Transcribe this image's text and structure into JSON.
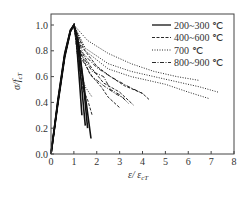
{
  "chart_data": {
    "type": "line",
    "title": "",
    "xlabel": "ε/ ε_cT",
    "ylabel": "σ/f_cT",
    "xlim": [
      0,
      8
    ],
    "ylim": [
      0,
      1.05
    ],
    "xticks": [
      0,
      1,
      2,
      3,
      4,
      5,
      6,
      7,
      8
    ],
    "yticks": [
      0.0,
      0.2,
      0.4,
      0.6,
      0.8,
      1.0
    ],
    "xtick_labels": [
      "0",
      "1",
      "2",
      "3",
      "4",
      "5",
      "6",
      "7",
      "8"
    ],
    "ytick_labels": [
      "0.0",
      "0.2",
      "0.4",
      "0.6",
      "0.8",
      "1.0"
    ],
    "grid": false,
    "legend_position": "upper right",
    "series": [
      {
        "name": "200~300 ℃",
        "style": "solid",
        "curves": [
          [
            [
              0,
              0
            ],
            [
              0.3,
              0.42
            ],
            [
              0.6,
              0.78
            ],
            [
              0.85,
              0.96
            ],
            [
              1.0,
              1.0
            ],
            [
              1.1,
              0.9
            ],
            [
              1.25,
              0.55
            ],
            [
              1.35,
              0.3
            ]
          ],
          [
            [
              0,
              0
            ],
            [
              0.3,
              0.4
            ],
            [
              0.6,
              0.76
            ],
            [
              0.85,
              0.95
            ],
            [
              1.0,
              1.0
            ],
            [
              1.15,
              0.88
            ],
            [
              1.35,
              0.5
            ],
            [
              1.5,
              0.22
            ]
          ],
          [
            [
              0,
              0
            ],
            [
              0.3,
              0.41
            ],
            [
              0.6,
              0.77
            ],
            [
              0.85,
              0.96
            ],
            [
              1.0,
              1.0
            ],
            [
              1.2,
              0.86
            ],
            [
              1.45,
              0.48
            ],
            [
              1.6,
              0.2
            ]
          ],
          [
            [
              0,
              0
            ],
            [
              0.3,
              0.39
            ],
            [
              0.6,
              0.75
            ],
            [
              0.85,
              0.95
            ],
            [
              1.0,
              1.0
            ],
            [
              1.2,
              0.85
            ],
            [
              1.5,
              0.45
            ],
            [
              1.75,
              0.12
            ]
          ]
        ]
      },
      {
        "name": "400~600 ℃",
        "style": "dashed",
        "curves": [
          [
            [
              0,
              0
            ],
            [
              0.3,
              0.4
            ],
            [
              0.6,
              0.76
            ],
            [
              0.85,
              0.95
            ],
            [
              1.0,
              1.0
            ],
            [
              1.3,
              0.78
            ],
            [
              1.7,
              0.62
            ],
            [
              2.2,
              0.52
            ],
            [
              2.5,
              0.44
            ],
            [
              3.0,
              0.36
            ]
          ],
          [
            [
              0,
              0
            ],
            [
              0.3,
              0.4
            ],
            [
              0.6,
              0.76
            ],
            [
              0.85,
              0.95
            ],
            [
              1.0,
              1.0
            ],
            [
              1.3,
              0.8
            ],
            [
              1.8,
              0.66
            ],
            [
              2.3,
              0.55
            ],
            [
              3.0,
              0.48
            ],
            [
              3.6,
              0.38
            ]
          ],
          [
            [
              0,
              0
            ],
            [
              0.3,
              0.4
            ],
            [
              0.6,
              0.76
            ],
            [
              0.85,
              0.95
            ],
            [
              1.0,
              1.0
            ],
            [
              1.4,
              0.82
            ],
            [
              2.0,
              0.68
            ],
            [
              2.6,
              0.6
            ],
            [
              3.2,
              0.53
            ],
            [
              4.0,
              0.47
            ],
            [
              4.3,
              0.42
            ]
          ],
          [
            [
              0,
              0
            ],
            [
              0.3,
              0.4
            ],
            [
              0.6,
              0.76
            ],
            [
              0.85,
              0.95
            ],
            [
              1.0,
              1.0
            ],
            [
              1.2,
              0.7
            ],
            [
              1.4,
              0.5
            ],
            [
              1.6,
              0.42
            ],
            [
              1.8,
              0.3
            ]
          ]
        ]
      },
      {
        "name": "700 ℃",
        "style": "dotted",
        "curves": [
          [
            [
              0,
              0
            ],
            [
              0.3,
              0.4
            ],
            [
              0.6,
              0.76
            ],
            [
              0.85,
              0.95
            ],
            [
              1.0,
              1.0
            ],
            [
              1.6,
              0.88
            ],
            [
              2.5,
              0.78
            ],
            [
              3.5,
              0.7
            ],
            [
              4.5,
              0.64
            ],
            [
              5.5,
              0.6
            ],
            [
              6.5,
              0.57
            ]
          ],
          [
            [
              0,
              0
            ],
            [
              0.3,
              0.4
            ],
            [
              0.6,
              0.76
            ],
            [
              0.85,
              0.95
            ],
            [
              1.0,
              1.0
            ],
            [
              1.5,
              0.82
            ],
            [
              2.5,
              0.7
            ],
            [
              3.5,
              0.64
            ],
            [
              5.0,
              0.58
            ],
            [
              6.5,
              0.52
            ],
            [
              7.3,
              0.48
            ]
          ],
          [
            [
              0,
              0
            ],
            [
              0.3,
              0.4
            ],
            [
              0.6,
              0.76
            ],
            [
              0.85,
              0.95
            ],
            [
              1.0,
              1.0
            ],
            [
              1.5,
              0.8
            ],
            [
              2.5,
              0.66
            ],
            [
              3.5,
              0.6
            ],
            [
              5.0,
              0.54
            ],
            [
              6.0,
              0.48
            ],
            [
              6.9,
              0.43
            ]
          ],
          [
            [
              0,
              0
            ],
            [
              0.3,
              0.4
            ],
            [
              0.6,
              0.76
            ],
            [
              0.85,
              0.95
            ],
            [
              1.0,
              1.0
            ],
            [
              1.2,
              0.7
            ],
            [
              1.5,
              0.52
            ],
            [
              1.8,
              0.44
            ]
          ]
        ]
      },
      {
        "name": "800~900 ℃",
        "style": "dash-dot",
        "curves": [
          [
            [
              0,
              0
            ],
            [
              0.3,
              0.4
            ],
            [
              0.6,
              0.76
            ],
            [
              0.85,
              0.95
            ],
            [
              1.0,
              1.0
            ],
            [
              1.4,
              0.78
            ],
            [
              2.0,
              0.67
            ],
            [
              2.6,
              0.6
            ],
            [
              3.3,
              0.53
            ],
            [
              4.0,
              0.47
            ]
          ],
          [
            [
              0,
              0
            ],
            [
              0.3,
              0.4
            ],
            [
              0.6,
              0.76
            ],
            [
              0.85,
              0.95
            ],
            [
              1.0,
              1.0
            ],
            [
              1.3,
              0.78
            ],
            [
              1.8,
              0.64
            ],
            [
              2.3,
              0.6
            ],
            [
              2.6,
              0.5
            ],
            [
              3.0,
              0.46
            ],
            [
              3.4,
              0.39
            ]
          ],
          [
            [
              0,
              0
            ],
            [
              0.3,
              0.4
            ],
            [
              0.6,
              0.76
            ],
            [
              0.85,
              0.95
            ],
            [
              1.0,
              1.0
            ],
            [
              1.3,
              0.75
            ],
            [
              1.8,
              0.6
            ],
            [
              2.3,
              0.53
            ],
            [
              2.8,
              0.47
            ],
            [
              3.2,
              0.43
            ]
          ]
        ]
      }
    ]
  },
  "legend": {
    "items": [
      {
        "label": "200~300 ℃",
        "style": "solid"
      },
      {
        "label": "400~600 ℃",
        "style": "dashed"
      },
      {
        "label": "700 ℃",
        "style": "dotted"
      },
      {
        "label": "800~900 ℃",
        "style": "dash-dot"
      }
    ]
  },
  "axes": {
    "xlabel_main": "ε/ ε",
    "xlabel_sub": "cT",
    "ylabel_main": "σ/f",
    "ylabel_sub": "cT"
  }
}
